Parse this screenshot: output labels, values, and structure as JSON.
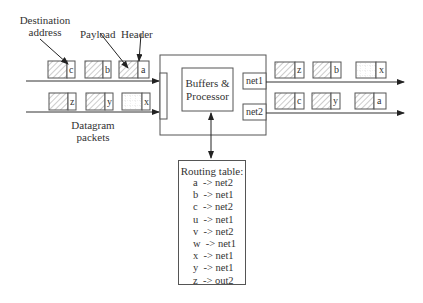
{
  "labels": {
    "destination_address": [
      "Destination",
      "address"
    ],
    "payload": "Payload",
    "header": "Header",
    "datagram_packets": [
      "Datagram",
      "packets"
    ]
  },
  "router": {
    "processor_label": [
      "Buffers &",
      "Processor"
    ],
    "ports": [
      "net1",
      "net2"
    ]
  },
  "input_rows": [
    {
      "packets": [
        {
          "address": "c",
          "pattern": "hatch"
        },
        {
          "address": "b",
          "pattern": "hatch"
        },
        {
          "address": "a",
          "pattern": "hatch"
        }
      ]
    },
    {
      "packets": [
        {
          "address": "z",
          "pattern": "hatch"
        },
        {
          "address": "y",
          "pattern": "hatch"
        },
        {
          "address": "x",
          "pattern": "grid"
        }
      ]
    }
  ],
  "output_rows": [
    {
      "port": "net1",
      "packets": [
        {
          "address": "z",
          "pattern": "hatch"
        },
        {
          "address": "b",
          "pattern": "hatch"
        },
        {
          "address": "x",
          "pattern": "grid"
        }
      ]
    },
    {
      "port": "net2",
      "packets": [
        {
          "address": "c",
          "pattern": "hatch"
        },
        {
          "address": "y",
          "pattern": "hatch"
        },
        {
          "address": "a",
          "pattern": "hatch"
        }
      ]
    }
  ],
  "routing_table": {
    "title": "Routing table:",
    "entries": [
      {
        "dest": "a",
        "route": "net2",
        "text": "a  -> net2"
      },
      {
        "dest": "b",
        "route": "net1",
        "text": "b  -> net1"
      },
      {
        "dest": "c",
        "route": "net2",
        "text": "c  -> net2"
      },
      {
        "dest": "u",
        "route": "net1",
        "text": "u  -> net1"
      },
      {
        "dest": "v",
        "route": "net2",
        "text": "v  -> net2"
      },
      {
        "dest": "w",
        "route": "net1",
        "text": "w  -> net1"
      },
      {
        "dest": "x",
        "route": "net1",
        "text": "x  -> net1"
      },
      {
        "dest": "y",
        "route": "net1",
        "text": "y  -> net1"
      },
      {
        "dest": "z",
        "route": "out2",
        "text": "z  -> out2"
      }
    ]
  },
  "colors": {
    "stroke": "#555555",
    "hatch": "#888888",
    "text": "#333333"
  }
}
